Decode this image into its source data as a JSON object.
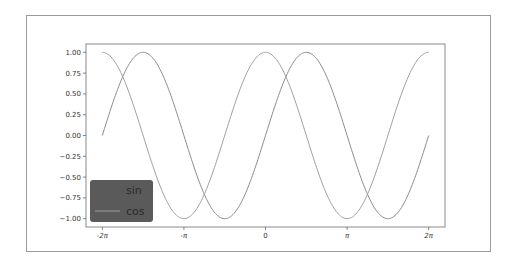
{
  "chart_data": {
    "type": "line",
    "title": "",
    "xlabel": "",
    "ylabel": "",
    "xlim": [
      -6.9115,
      6.9115
    ],
    "ylim": [
      -1.1,
      1.1
    ],
    "grid": false,
    "x_ticks": [
      {
        "value": -6.2832,
        "label": "-2π"
      },
      {
        "value": -3.1416,
        "label": "-π"
      },
      {
        "value": 0,
        "label": "0"
      },
      {
        "value": 3.1416,
        "label": "π"
      },
      {
        "value": 6.2832,
        "label": "2π"
      }
    ],
    "y_ticks": [
      {
        "value": 1.0,
        "label": "1.00"
      },
      {
        "value": 0.75,
        "label": "0.75"
      },
      {
        "value": 0.5,
        "label": "0.50"
      },
      {
        "value": 0.25,
        "label": "0.25"
      },
      {
        "value": 0.0,
        "label": "0.00"
      },
      {
        "value": -0.25,
        "label": "−0.25"
      },
      {
        "value": -0.5,
        "label": "−0.50"
      },
      {
        "value": -0.75,
        "label": "−0.75"
      },
      {
        "value": -1.0,
        "label": "−1.00"
      }
    ],
    "x_range": [
      -6.2832,
      6.2832
    ],
    "series": [
      {
        "name": "sin",
        "function": "sin",
        "color": "#8c8c8c"
      },
      {
        "name": "cos",
        "function": "cos",
        "color": "#a0a0a0"
      }
    ],
    "legend": {
      "position": "lower left",
      "entries": [
        {
          "label": "sin",
          "handle_color": "#5a5a5a"
        },
        {
          "label": "cos",
          "handle_color": "#8f8f8f"
        }
      ],
      "background": "#5a5a5a"
    }
  },
  "colors": {
    "axes_border": "#8a8a8a",
    "frame_border": "#9a9a9a",
    "curve": "#8c8c8c"
  }
}
